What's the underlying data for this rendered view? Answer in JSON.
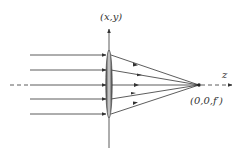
{
  "diagram": {
    "labels": {
      "transverse_axis": "(x,y)",
      "optical_axis": "z",
      "focal_point": "(0,0,f′)"
    },
    "geometry": {
      "lens_x": 109,
      "lens_top": 50,
      "lens_bottom": 118,
      "axis_y": 85,
      "focal_x": 199,
      "ray_start_x": 30,
      "ray_heights": [
        55,
        70,
        85,
        99,
        114
      ]
    },
    "colors": {
      "line": "#333333",
      "lens_dark": "#444444",
      "lens_light": "#d8d8d8"
    }
  }
}
